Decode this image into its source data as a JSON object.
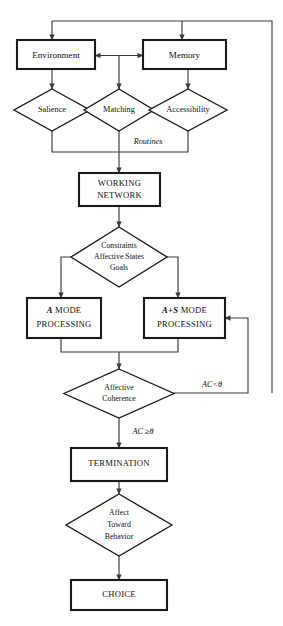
{
  "diagram": {
    "type": "flowchart",
    "colors": {
      "background": "#ffffff",
      "box_stroke": "#1a1a1a",
      "diamond_stroke": "#1a1a1a",
      "connector_stroke": "#3a3a3a",
      "text": "#111111"
    },
    "nodes": {
      "environment": {
        "label": "Environment",
        "shape": "rectangle"
      },
      "memory": {
        "label": "Memory",
        "shape": "rectangle"
      },
      "salience": {
        "label": "Salience",
        "shape": "diamond"
      },
      "matching": {
        "label": "Matching",
        "shape": "diamond"
      },
      "accessibility": {
        "label": "Accessibility",
        "shape": "diamond"
      },
      "working_network": {
        "shape": "rectangle",
        "line1": "WORKING",
        "line2": "NETWORK"
      },
      "constraints": {
        "shape": "diamond",
        "line1": "Constraints",
        "line2": "Affective States",
        "line3": "Goals"
      },
      "a_mode": {
        "shape": "rectangle",
        "emph": "A",
        "line1_rest": " MODE",
        "line2": "PROCESSING"
      },
      "as_mode": {
        "shape": "rectangle",
        "emph": "A+S",
        "line1_rest": " MODE",
        "line2": "PROCESSING"
      },
      "affective_coherence": {
        "shape": "diamond",
        "line1": "Affective",
        "line2": "Coherence"
      },
      "termination": {
        "label": "TERMINATION",
        "shape": "rectangle"
      },
      "affect_toward_behavior": {
        "shape": "diamond",
        "line1": "Affect",
        "line2": "Toward",
        "line3": "Behavior"
      },
      "choice": {
        "label": "CHOICE",
        "shape": "rectangle"
      }
    },
    "edge_labels": {
      "routines": "Routines",
      "ac_below_threshold": "AC<θ",
      "ac_at_or_above_threshold": "AC ≥θ"
    }
  }
}
